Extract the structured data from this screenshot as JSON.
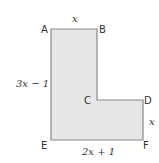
{
  "figure": {
    "shape": "L-shaped polygon",
    "fill_color": "#e6e6e6",
    "stroke_color": "#888888",
    "vertices": {
      "A": "A",
      "B": "B",
      "C": "C",
      "D": "D",
      "E": "E",
      "F": "F"
    },
    "dimensions": {
      "AB": "x",
      "AE": "3x − 1",
      "DF": "x",
      "EF": "2x + 1"
    }
  }
}
